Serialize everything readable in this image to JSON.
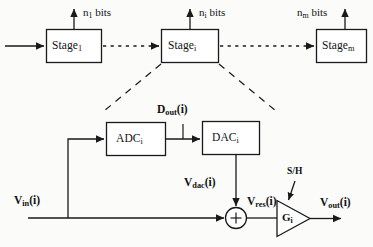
{
  "figure": {
    "type": "block-diagram"
  },
  "pipeline": {
    "input_arrow": "input-signal-arrow",
    "stages": [
      {
        "name": "stage-1",
        "label": "Stage",
        "sub": "1",
        "bits_label": "bits",
        "bits_n": "n",
        "bits_sub": "1"
      },
      {
        "name": "stage-i",
        "label": "Stage",
        "sub": "i",
        "bits_label": "bits",
        "bits_n": "n",
        "bits_sub": "i"
      },
      {
        "name": "stage-m",
        "label": "Stage",
        "sub": "m",
        "bits_label": "bits",
        "bits_n": "n",
        "bits_sub": "m"
      }
    ]
  },
  "detail": {
    "adc": {
      "label": "ADC",
      "sub": "i"
    },
    "dac": {
      "label": "DAC",
      "sub": "i"
    },
    "gain": {
      "label": "G",
      "sub": "i"
    },
    "summer": {
      "sign": "+"
    },
    "sample_hold": "S/H",
    "signals": {
      "d_out": {
        "base": "D",
        "sub": "out",
        "arg": "(i)"
      },
      "v_in": {
        "base": "V",
        "sub": "in",
        "arg": "(i)"
      },
      "v_dac": {
        "base": "V",
        "sub": "dac",
        "arg": "(i)"
      },
      "v_res": {
        "base": "V",
        "sub": "res",
        "arg": "(i)"
      },
      "v_out": {
        "base": "V",
        "sub": "out",
        "arg": "(i)"
      }
    }
  },
  "colors": {
    "stroke": "#1a1a1a",
    "background": "#fbfbf9",
    "box_fill": "#ffffff"
  }
}
